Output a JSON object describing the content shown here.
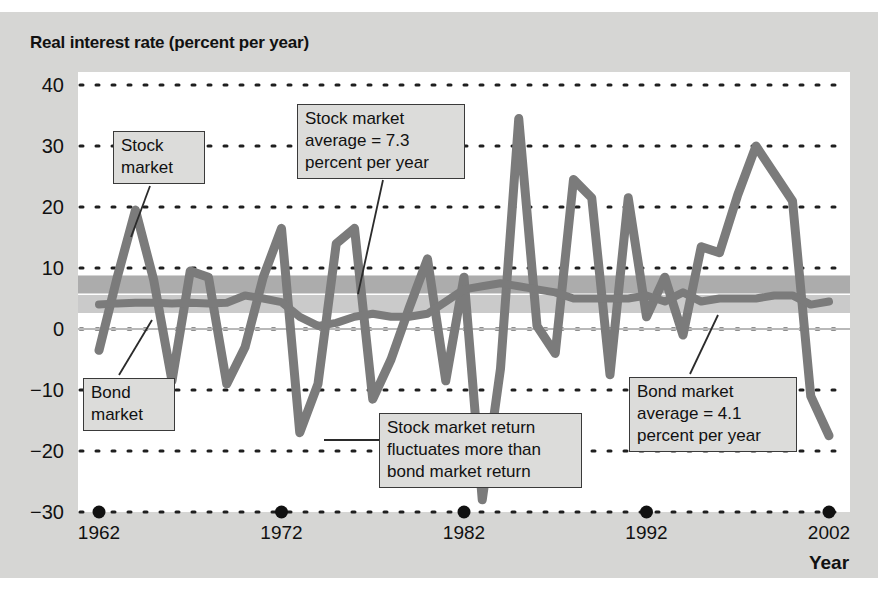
{
  "figure": {
    "title": "Real interest rate (percent per year)",
    "x_axis_title": "Year"
  },
  "chart_data": {
    "type": "line",
    "title": "Real interest rate (percent per year)",
    "xlabel": "Year",
    "ylabel": "Real interest rate (percent per year)",
    "xlim": [
      1962,
      2002
    ],
    "ylim": [
      -30,
      40
    ],
    "yticks": [
      40,
      30,
      20,
      10,
      0,
      -10,
      -20,
      -30
    ],
    "ytick_labels": [
      "40",
      "30",
      "20",
      "10",
      "0",
      "−10",
      "−20",
      "−30"
    ],
    "xticks": [
      1962,
      1972,
      1982,
      1992,
      2002
    ],
    "xtick_labels": [
      "1962",
      "1972",
      "1982",
      "1992",
      "2002"
    ],
    "grid": "horizontal-dotted",
    "legend": "inline-callouts",
    "x": [
      1962,
      1963,
      1964,
      1965,
      1966,
      1967,
      1968,
      1969,
      1970,
      1971,
      1972,
      1973,
      1974,
      1975,
      1976,
      1977,
      1978,
      1979,
      1980,
      1981,
      1982,
      1983,
      1984,
      1985,
      1986,
      1987,
      1988,
      1989,
      1990,
      1991,
      1992,
      1993,
      1994,
      1995,
      1996,
      1997,
      1998,
      1999,
      2000,
      2001,
      2002
    ],
    "series": [
      {
        "name": "Stock market",
        "color": "#7b7b7b",
        "average": 7.3,
        "average_label": "Stock market average = 7.3 percent per year",
        "values": [
          -3.5,
          8.5,
          19.5,
          8.0,
          -8.5,
          9.5,
          8.5,
          -9.0,
          -3.0,
          8.5,
          16.5,
          -17.0,
          -9.0,
          14.0,
          16.5,
          -11.5,
          -5.0,
          3.5,
          11.5,
          -8.5,
          8.5,
          -28.0,
          -6.5,
          34.5,
          0.5,
          -4.0,
          24.5,
          21.5,
          -7.5,
          21.5,
          2.0,
          8.5,
          -1.0,
          13.5,
          12.5,
          22.0,
          30.0,
          25.5,
          21.0,
          -11.0,
          -17.5
        ]
      },
      {
        "name": "Bond market",
        "color": "#7b7b7b",
        "average": 4.1,
        "average_label": "Bond market average = 4.1 percent per year",
        "values": [
          4.0,
          4.2,
          4.3,
          4.3,
          4.2,
          4.3,
          4.2,
          4.3,
          5.5,
          5.0,
          4.4,
          2.0,
          0.5,
          1.0,
          2.0,
          2.5,
          2.0,
          2.0,
          2.5,
          4.5,
          6.5,
          7.0,
          7.5,
          7.0,
          6.5,
          6.0,
          5.0,
          5.0,
          5.0,
          5.0,
          5.5,
          4.5,
          6.0,
          4.5,
          5.0,
          5.0,
          5.0,
          5.5,
          5.5,
          4.0,
          4.5
        ]
      }
    ],
    "average_bands": [
      {
        "name": "stock-market-average-band",
        "value": 7.3,
        "color": "#a8a8a8"
      },
      {
        "name": "bond-market-average-band",
        "value": 4.1,
        "color": "#c7c7c7"
      }
    ]
  },
  "annotations": [
    {
      "name": "stock-market-label",
      "text": "Stock\nmarket"
    },
    {
      "name": "stock-market-average-label",
      "text": "Stock market\naverage = 7.3\npercent per year"
    },
    {
      "name": "bond-market-label",
      "text": "Bond\nmarket"
    },
    {
      "name": "stock-fluctuation-label",
      "text": "Stock market return\nfluctuates more than\nbond market return"
    },
    {
      "name": "bond-market-average-label",
      "text": "Bond market\naverage = 4.1\npercent per year"
    }
  ],
  "colors": {
    "card_background": "#d6d6d4",
    "panel_background": "#ffffff",
    "line": "#7b7b7b",
    "callout_background": "#dcdcda",
    "text": "#111111"
  }
}
